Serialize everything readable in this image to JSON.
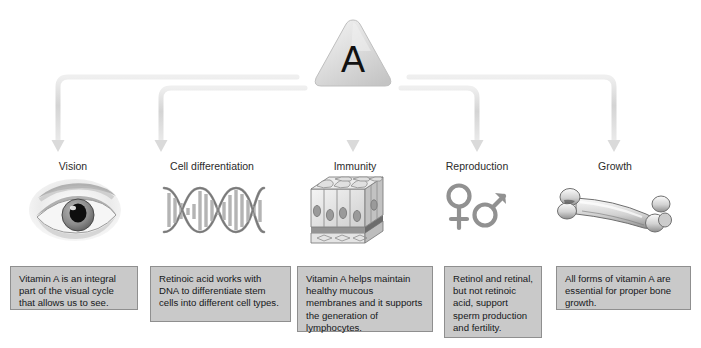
{
  "diagram": {
    "center_node": {
      "label": "A",
      "shape": "rounded-triangle",
      "fill": "#dcdcdc",
      "text_color": "#111111"
    },
    "connector_color": "#d6d6d6",
    "caption_fill": "#c9c9c9",
    "caption_border": "#8f8f8f",
    "background": "#ffffff"
  },
  "branches": [
    {
      "id": "vision",
      "label": "Vision",
      "icon": "eye-icon",
      "caption": "Vitamin A is an integral part of the visual cycle that allows us to see."
    },
    {
      "id": "cell-differentiation",
      "label": "Cell differentiation",
      "icon": "dna-helix-icon",
      "caption": "Retinoic acid works with DNA to differentiate stem cells into different cell types."
    },
    {
      "id": "immunity",
      "label": "Immunity",
      "icon": "epithelial-tissue-icon",
      "caption": "Vitamin A helps maintain healthy mucous membranes and it supports the generation of lymphocytes."
    },
    {
      "id": "reproduction",
      "label": "Reproduction",
      "icon": "gender-symbols-icon",
      "caption": "Retinol and retinal, but not retinoic acid, support sperm production and fertility."
    },
    {
      "id": "growth",
      "label": "Growth",
      "icon": "bone-icon",
      "caption": "All forms of vitamin A are essential for proper bone growth."
    }
  ]
}
